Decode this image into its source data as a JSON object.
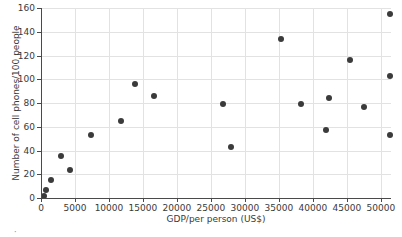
{
  "chart_data": {
    "type": "scatter",
    "title": "",
    "xlabel": "GDP/per person (US$)",
    "ylabel": "Number of cell phones/100 people",
    "xlim": [
      0,
      51500
    ],
    "ylim": [
      0,
      160
    ],
    "xticks": [
      0,
      5000,
      10000,
      15000,
      20000,
      25000,
      30000,
      35000,
      40000,
      45000,
      50000
    ],
    "xticklabels": [
      "0",
      "5000",
      "10000",
      "15000",
      "20000",
      "25000",
      "30000",
      "35000",
      "40000",
      "45000",
      "50000"
    ],
    "yticks": [
      0,
      20,
      40,
      60,
      80,
      100,
      120,
      140,
      160
    ],
    "yticklabels": [
      "0",
      "20",
      "40",
      "60",
      "80",
      "100",
      "120",
      "140",
      "160"
    ],
    "grid": true,
    "grid_color": "#e2e2e2",
    "marker_color": "#3b3b3b",
    "marker_size": 6,
    "legend": null,
    "series": [
      {
        "name": "countries",
        "points": [
          {
            "x": 400,
            "y": 2
          },
          {
            "x": 700,
            "y": 7
          },
          {
            "x": 1500,
            "y": 15
          },
          {
            "x": 2900,
            "y": 35
          },
          {
            "x": 4200,
            "y": 24
          },
          {
            "x": 7300,
            "y": 53
          },
          {
            "x": 11700,
            "y": 65
          },
          {
            "x": 13800,
            "y": 96
          },
          {
            "x": 16700,
            "y": 86
          },
          {
            "x": 26800,
            "y": 79
          },
          {
            "x": 28000,
            "y": 43
          },
          {
            "x": 35300,
            "y": 134
          },
          {
            "x": 38300,
            "y": 79
          },
          {
            "x": 42000,
            "y": 57
          },
          {
            "x": 42400,
            "y": 84
          },
          {
            "x": 45500,
            "y": 116
          },
          {
            "x": 47600,
            "y": 77
          },
          {
            "x": 51400,
            "y": 155
          },
          {
            "x": 51400,
            "y": 103
          },
          {
            "x": 51400,
            "y": 53
          }
        ]
      }
    ]
  },
  "figure": {
    "corner_mark": "·"
  }
}
